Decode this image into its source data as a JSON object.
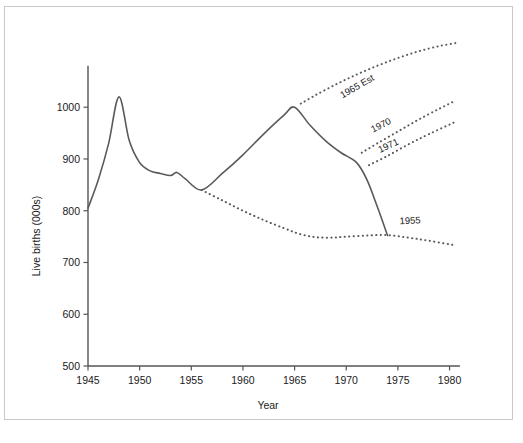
{
  "figure": {
    "caption": "",
    "frame_color": "#c8c8c8",
    "line_color": "#5a5a5a",
    "text_color": "#1a1a1a"
  },
  "chart_data": {
    "type": "line",
    "title": "",
    "xlabel": "Year",
    "ylabel": "Live births (000s)",
    "xlim": [
      1945,
      1981
    ],
    "ylim": [
      500,
      1080
    ],
    "xticks": [
      1945,
      1950,
      1955,
      1960,
      1965,
      1970,
      1975,
      1980
    ],
    "xtick_labels": [
      "1945",
      "1950",
      "1955",
      "1960",
      "1965",
      "1970",
      "1975",
      "1980"
    ],
    "yticks": [
      500,
      600,
      700,
      800,
      900,
      1000
    ],
    "ytick_labels": [
      "500",
      "600",
      "700",
      "800",
      "900",
      "1000"
    ],
    "grid": false,
    "legend": "inline-annotations",
    "series": [
      {
        "name": "actual",
        "style": "solid",
        "label": "",
        "x": [
          1945,
          1946,
          1947,
          1948,
          1949,
          1950,
          1951,
          1952,
          1953,
          1953.6,
          1954.4,
          1956,
          1958,
          1960,
          1962,
          1964,
          1965,
          1966.5,
          1968,
          1969.5,
          1971,
          1972,
          1973,
          1974
        ],
        "y": [
          805,
          860,
          930,
          1020,
          935,
          893,
          877,
          872,
          868,
          874,
          862,
          840,
          872,
          908,
          948,
          985,
          1000,
          965,
          935,
          912,
          893,
          860,
          808,
          752
        ]
      },
      {
        "name": "projection-1965-est",
        "style": "dotted",
        "label": "1965 Est",
        "label_angle": -30,
        "label_x": 1971.2,
        "label_y": 1035,
        "x": [
          1965.6,
          1967,
          1969,
          1971,
          1973,
          1975,
          1977,
          1979,
          1980.6
        ],
        "y": [
          1007,
          1023,
          1044,
          1063,
          1080,
          1095,
          1108,
          1118,
          1124
        ]
      },
      {
        "name": "projection-1970",
        "style": "dotted",
        "label": "1970",
        "label_angle": -27,
        "label_x": 1973.5,
        "label_y": 960,
        "x": [
          1971.5,
          1973,
          1975,
          1977,
          1979,
          1980.6
        ],
        "y": [
          912,
          930,
          953,
          976,
          997,
          1013
        ]
      },
      {
        "name": "projection-1971",
        "style": "dotted",
        "label": "1971",
        "label_angle": -25,
        "label_x": 1974.2,
        "label_y": 920,
        "x": [
          1972.2,
          1974,
          1976,
          1978,
          1980.6
        ],
        "y": [
          888,
          906,
          928,
          948,
          972
        ]
      },
      {
        "name": "projection-1955",
        "style": "dotted",
        "label": "1955",
        "label_angle": -3,
        "label_x": 1976.2,
        "label_y": 775,
        "x": [
          1956,
          1958,
          1960,
          1962,
          1964,
          1965.5,
          1967,
          1968.5,
          1970,
          1972,
          1974,
          1976,
          1978,
          1980.6
        ],
        "y": [
          840,
          820,
          800,
          782,
          766,
          755,
          749,
          748,
          750,
          752,
          753,
          748,
          742,
          733
        ]
      }
    ]
  }
}
